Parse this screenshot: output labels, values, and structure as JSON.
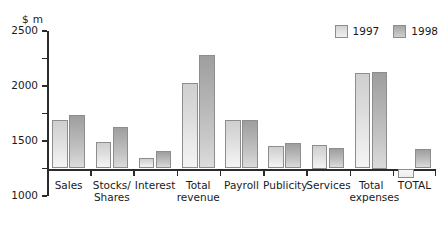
{
  "chart_data": {
    "type": "bar",
    "title": "",
    "subtitle": "",
    "xlabel": "",
    "ylabel": "$ m",
    "unit_label": "$ m",
    "ylim": [
      -500,
      2500
    ],
    "yticks": [
      2500,
      2000,
      1500,
      1000,
      500,
      0,
      -500
    ],
    "ytick_labels": [
      "2500",
      "2000",
      "1500",
      "1000",
      "500",
      "0",
      "-500"
    ],
    "grid": false,
    "legend_position": "top-right",
    "categories": [
      "Sales",
      "Stocks/\nShares",
      "Interest",
      "Total\nrevenue",
      "Payroll",
      "Publicity",
      "Services",
      "Total\nexpenses",
      "TOTAL"
    ],
    "series": [
      {
        "name": "1997",
        "color": "#dcdcdc",
        "values": [
          880,
          485,
          190,
          1555,
          880,
          410,
          425,
          1745,
          -180
        ]
      },
      {
        "name": "1998",
        "color": "#b4b4b4",
        "values": [
          965,
          755,
          320,
          2070,
          885,
          460,
          380,
          1750,
          355
        ]
      }
    ]
  },
  "legend": {
    "entries": [
      {
        "label": "1997",
        "swatch": "light-gray"
      },
      {
        "label": "1998",
        "swatch": "dark-gray"
      }
    ]
  },
  "colors": {
    "axis": "#2b2b2b",
    "bar_border": "#8d8d8d",
    "series_1997": "#dcdcdc",
    "series_1998": "#b4b4b4",
    "text": "#1a1a1a",
    "background": "#ffffff"
  }
}
